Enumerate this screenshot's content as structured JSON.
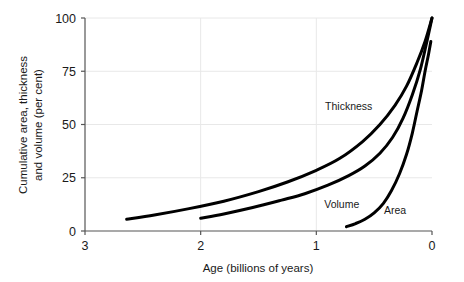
{
  "chart_data": {
    "type": "line",
    "title": "",
    "xlabel": "Age (billions of years)",
    "ylabel_line1": "Cumulative area, thickness",
    "ylabel_line2": "and volume (per cent)",
    "xlim": [
      3,
      0
    ],
    "ylim": [
      0,
      100
    ],
    "x_ticks": [
      3,
      2,
      1,
      0
    ],
    "x_tick_labels": [
      "3",
      "2",
      "1",
      "0"
    ],
    "y_ticks": [
      0,
      25,
      50,
      75,
      100
    ],
    "y_tick_labels": [
      "0",
      "25",
      "50",
      "75",
      "100"
    ],
    "grid": true,
    "grid_color": "#e8e8e8",
    "axis_color": "#555555",
    "line_color": "#000000",
    "line_width": 3,
    "legend": "inline-annotations",
    "series": [
      {
        "name": "Thickness",
        "label_x": 0.72,
        "label_y": 57,
        "points": [
          {
            "x": 2.64,
            "y": 5.5
          },
          {
            "x": 2.4,
            "y": 7.5
          },
          {
            "x": 2.1,
            "y": 10.5
          },
          {
            "x": 1.8,
            "y": 14.0
          },
          {
            "x": 1.5,
            "y": 18.5
          },
          {
            "x": 1.25,
            "y": 23.0
          },
          {
            "x": 1.0,
            "y": 28.5
          },
          {
            "x": 0.8,
            "y": 34.0
          },
          {
            "x": 0.6,
            "y": 42.0
          },
          {
            "x": 0.45,
            "y": 50.0
          },
          {
            "x": 0.32,
            "y": 59.0
          },
          {
            "x": 0.22,
            "y": 68.0
          },
          {
            "x": 0.13,
            "y": 79.0
          },
          {
            "x": 0.06,
            "y": 89.0
          },
          {
            "x": 0.0,
            "y": 100.0
          }
        ]
      },
      {
        "name": "Volume",
        "label_x": 0.78,
        "label_y": 11,
        "points": [
          {
            "x": 2.0,
            "y": 6.0
          },
          {
            "x": 1.8,
            "y": 8.0
          },
          {
            "x": 1.55,
            "y": 11.0
          },
          {
            "x": 1.3,
            "y": 14.5
          },
          {
            "x": 1.1,
            "y": 17.5
          },
          {
            "x": 0.9,
            "y": 21.5
          },
          {
            "x": 0.72,
            "y": 26.0
          },
          {
            "x": 0.58,
            "y": 30.5
          },
          {
            "x": 0.45,
            "y": 36.5
          },
          {
            "x": 0.34,
            "y": 44.0
          },
          {
            "x": 0.25,
            "y": 53.0
          },
          {
            "x": 0.17,
            "y": 64.0
          },
          {
            "x": 0.1,
            "y": 76.0
          },
          {
            "x": 0.04,
            "y": 90.0
          },
          {
            "x": 0.0,
            "y": 100.0
          }
        ]
      },
      {
        "name": "Area",
        "label_x": 0.32,
        "label_y": 8,
        "points": [
          {
            "x": 0.74,
            "y": 2.0
          },
          {
            "x": 0.66,
            "y": 3.5
          },
          {
            "x": 0.58,
            "y": 5.5
          },
          {
            "x": 0.5,
            "y": 8.5
          },
          {
            "x": 0.42,
            "y": 13.0
          },
          {
            "x": 0.35,
            "y": 19.0
          },
          {
            "x": 0.28,
            "y": 27.0
          },
          {
            "x": 0.22,
            "y": 36.0
          },
          {
            "x": 0.17,
            "y": 46.0
          },
          {
            "x": 0.13,
            "y": 56.0
          },
          {
            "x": 0.09,
            "y": 66.0
          },
          {
            "x": 0.06,
            "y": 75.0
          },
          {
            "x": 0.03,
            "y": 83.0
          },
          {
            "x": 0.01,
            "y": 89.0
          }
        ]
      }
    ]
  }
}
